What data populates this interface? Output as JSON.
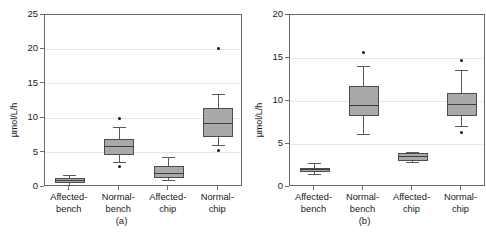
{
  "figure": {
    "width": 486,
    "height": 239,
    "background": "#ffffff",
    "box_fill": "#a9a9a9",
    "box_stroke": "#4d4d4d",
    "grid_color": "#e6e6e6",
    "frame_color": "#6b6b6b",
    "outlier_color": "#141414"
  },
  "panels": [
    {
      "key": "a",
      "label": "(a)",
      "ylabel": "µmol/L/h",
      "yticks": [
        "0",
        "5",
        "10",
        "15",
        "20",
        "25"
      ],
      "categories": [
        {
          "line1": "Affected-",
          "line2": "bench"
        },
        {
          "line1": "Normal-",
          "line2": "bench"
        },
        {
          "line1": "Affected-",
          "line2": "chip"
        },
        {
          "line1": "Normal-",
          "line2": "chip"
        }
      ]
    },
    {
      "key": "b",
      "label": "(b)",
      "ylabel": "µmol/L/h",
      "yticks": [
        "0",
        "5",
        "10",
        "15",
        "20"
      ],
      "categories": [
        {
          "line1": "Affected-",
          "line2": "bench"
        },
        {
          "line1": "Normal-",
          "line2": "bench"
        },
        {
          "line1": "Affected-",
          "line2": "chip"
        },
        {
          "line1": "Normal-",
          "line2": "chip"
        }
      ]
    }
  ],
  "chart_data": [
    {
      "type": "box",
      "panel": "(a)",
      "title": "",
      "xlabel": "",
      "ylabel": "µmol/L/h",
      "ylim": [
        0,
        25
      ],
      "ytick_values": [
        0,
        5,
        10,
        15,
        20,
        25
      ],
      "grid": true,
      "legend": "none",
      "categories": [
        "Affected-bench",
        "Normal-bench",
        "Affected-chip",
        "Normal-chip"
      ],
      "boxes": [
        {
          "category": "Affected-bench",
          "whisker_low": 0.2,
          "q1": 0.6,
          "median": 1.0,
          "q3": 1.3,
          "whisker_high": 1.7,
          "outliers": []
        },
        {
          "category": "Normal-bench",
          "whisker_low": 3.6,
          "q1": 4.6,
          "median": 5.9,
          "q3": 7.0,
          "whisker_high": 8.7,
          "outliers": [
            10.0,
            3.0
          ]
        },
        {
          "category": "Affected-chip",
          "whisker_low": 0.9,
          "q1": 1.3,
          "median": 1.9,
          "q3": 3.0,
          "whisker_high": 4.3,
          "outliers": []
        },
        {
          "category": "Normal-chip",
          "whisker_low": 6.0,
          "q1": 7.2,
          "median": 9.2,
          "q3": 11.5,
          "whisker_high": 13.5,
          "outliers": [
            20.2,
            5.3
          ]
        }
      ]
    },
    {
      "type": "box",
      "panel": "(b)",
      "title": "",
      "xlabel": "",
      "ylabel": "µmol/L/h",
      "ylim": [
        0,
        20
      ],
      "ytick_values": [
        0,
        5,
        10,
        15,
        20
      ],
      "grid": true,
      "legend": "none",
      "categories": [
        "Affected-bench",
        "Normal-bench",
        "Affected-chip",
        "Normal-chip"
      ],
      "boxes": [
        {
          "category": "Affected-bench",
          "whisker_low": 1.5,
          "q1": 1.7,
          "median": 2.0,
          "q3": 2.2,
          "whisker_high": 2.7,
          "outliers": []
        },
        {
          "category": "Normal-bench",
          "whisker_low": 6.1,
          "q1": 8.2,
          "median": 9.5,
          "q3": 11.7,
          "whisker_high": 14.0,
          "outliers": [
            15.6
          ]
        },
        {
          "category": "Affected-chip",
          "whisker_low": 2.9,
          "q1": 3.0,
          "median": 3.5,
          "q3": 4.0,
          "whisker_high": 4.0,
          "outliers": []
        },
        {
          "category": "Normal-chip",
          "whisker_low": 7.0,
          "q1": 8.3,
          "median": 9.6,
          "q3": 10.9,
          "whisker_high": 13.6,
          "outliers": [
            14.7,
            6.3
          ]
        }
      ]
    }
  ]
}
